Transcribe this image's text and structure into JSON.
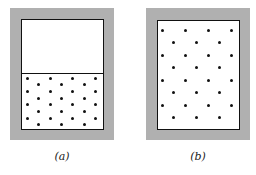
{
  "figure": {
    "panels": [
      {
        "id": "a",
        "label": "(a)",
        "description": "Gas confined to lower half of container by a partition",
        "frame": {
          "x": 10,
          "y": 8,
          "w": 104,
          "h": 132
        },
        "box": {
          "x": 21,
          "y": 19,
          "w": 83,
          "h": 111
        },
        "partition_y": 73,
        "dot_rows": {
          "start_y": 78,
          "row_step": 6.7,
          "rows": 8,
          "long_row_xs": [
            27,
            50,
            72,
            95
          ],
          "short_row_xs": [
            38,
            61,
            84
          ]
        }
      },
      {
        "id": "b",
        "label": "(b)",
        "description": "Gas expanded to fill the whole container",
        "frame": {
          "x": 146,
          "y": 8,
          "w": 104,
          "h": 132
        },
        "box": {
          "x": 157,
          "y": 20,
          "w": 83,
          "h": 110
        },
        "partition_y": null,
        "dot_rows": {
          "start_y": 30,
          "row_step": 12.5,
          "rows": 8,
          "long_row_xs": [
            162,
            185,
            208,
            231
          ],
          "short_row_xs": [
            173,
            196,
            219
          ]
        }
      }
    ],
    "colors": {
      "frame": "#b0b0b0",
      "box_border": "#111111",
      "dot": "#111111",
      "background": "#ffffff"
    }
  }
}
